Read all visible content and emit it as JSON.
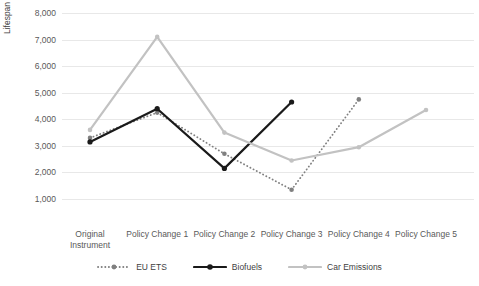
{
  "chart_data": {
    "type": "line",
    "title": "",
    "xlabel": "",
    "ylabel": "Lifespan (days)",
    "categories": [
      "Original Instrument",
      "Policy Change 1",
      "Policy Change 2",
      "Policy Change 3",
      "Policy Change 4",
      "Policy Change 5"
    ],
    "ylim": [
      0,
      8000
    ],
    "yticks": [
      1000,
      2000,
      3000,
      4000,
      5000,
      6000,
      7000,
      8000
    ],
    "ytick_labels": [
      "1,000",
      "2,000",
      "3,000",
      "4,000",
      "5,000",
      "6,000",
      "7,000",
      "8,000"
    ],
    "grid": true,
    "legend_position": "bottom",
    "series": [
      {
        "name": "EU ETS",
        "color": "#808080",
        "style": "dotted",
        "marker": "circle",
        "values": [
          3300,
          4250,
          2700,
          1350,
          4750,
          null
        ]
      },
      {
        "name": "Biofuels",
        "color": "#1a1a1a",
        "style": "solid",
        "marker": "circle-filled",
        "values": [
          3150,
          4400,
          2150,
          4650,
          null,
          null
        ]
      },
      {
        "name": "Car Emissions",
        "color": "#c2c2c2",
        "style": "solid",
        "marker": "circle",
        "values": [
          3600,
          7100,
          3500,
          2450,
          2950,
          4350
        ]
      }
    ]
  },
  "axis": {
    "y_title": "Lifespan (days)"
  },
  "legend": {
    "items": [
      {
        "label": "EU ETS"
      },
      {
        "label": "Biofuels"
      },
      {
        "label": "Car Emissions"
      }
    ]
  }
}
